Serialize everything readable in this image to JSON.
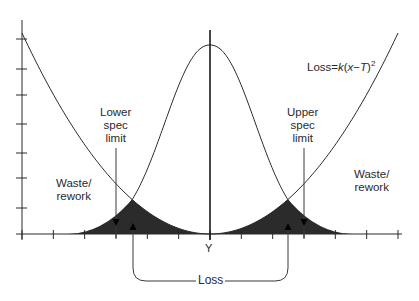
{
  "diagram": {
    "formula": {
      "prefix": "Loss",
      "equals": "=",
      "k": "k",
      "body_open": "(",
      "x": "x",
      "minus": "−",
      "T": "T",
      "body_close": ")",
      "exponent": "2"
    },
    "labels": {
      "lower_spec_line1": "Lower",
      "lower_spec_line2": "spec",
      "lower_spec_line3": "limit",
      "upper_spec_line1": "Upper",
      "upper_spec_line2": "spec",
      "upper_spec_line3": "limit",
      "waste_left_line1": "Waste/",
      "waste_left_line2": "rework",
      "waste_right_line1": "Waste/",
      "waste_right_line2": "rework",
      "target": "Y",
      "loss": "Loss"
    },
    "colors": {
      "line": "#2a2a2a",
      "fill": "#2b2b2b",
      "background": "#ffffff"
    },
    "axes": {
      "x_ticks": 13,
      "y_ticks": 8
    }
  }
}
